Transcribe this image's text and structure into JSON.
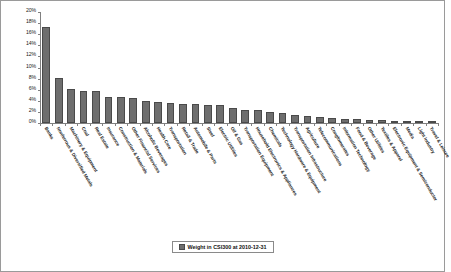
{
  "chart_data": {
    "type": "bar",
    "title": "",
    "xlabel": "",
    "ylabel": "",
    "ylim": [
      0,
      20
    ],
    "ytick_labels": [
      "20%",
      "18%",
      "16%",
      "14%",
      "12%",
      "10%",
      "8%",
      "6%",
      "4%",
      "2%",
      "0%"
    ],
    "ytick_values": [
      20,
      18,
      16,
      14,
      12,
      10,
      8,
      6,
      4,
      2,
      0
    ],
    "grid": false,
    "legend_position": "bottom-center",
    "legend": [
      "Weight in CSI300 at 2010-12-31"
    ],
    "series_name": "Weight in CSI300 at 2010-12-31",
    "bar_color": "#6e6e6e",
    "categories": [
      "Banks",
      "Nonferrous & Diversified Metals",
      "Machinery & Equipment",
      "Coal",
      "Real Estate",
      "Insurance",
      "Construction & Materials",
      "Other Financial Services",
      "Alcoholic Beverages",
      "Health Care",
      "Transportation",
      "Retail & Trade",
      "Automobile & Parts",
      "Steel",
      "Electric Utilities",
      "Oil & Gas",
      "Transportation Equipment",
      "Household Electronics & Appliances",
      "Chemicals",
      "Technology Hardware & Equipment",
      "Transportation Infrastructure",
      "Agriculture",
      "Telecommunications",
      "Conglomerates",
      "Information Technology",
      "Food & Beverage",
      "Other Utilities",
      "Textiles & Apparel",
      "Electronic Equipment & Semiconductor",
      "Media",
      "Light Industry",
      "Travel & Leisure"
    ],
    "values": [
      17.3,
      8.2,
      6.2,
      5.7,
      5.7,
      4.6,
      4.6,
      4.5,
      3.9,
      3.8,
      3.6,
      3.5,
      3.4,
      3.3,
      3.2,
      2.7,
      2.4,
      2.3,
      2.0,
      1.8,
      1.5,
      1.2,
      1.0,
      0.9,
      0.8,
      0.7,
      0.6,
      0.5,
      0.4,
      0.3,
      0.25,
      0.2
    ]
  },
  "legend": {
    "label": "Weight in CSI300 at 2010-12-31"
  }
}
